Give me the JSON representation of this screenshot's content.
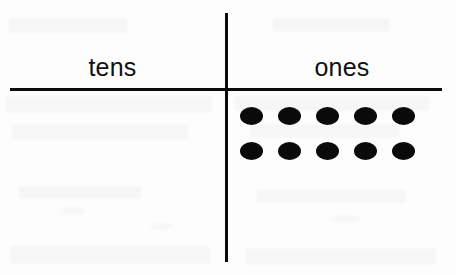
{
  "page": {
    "background_color": "#fdfdfd",
    "ink_color": "#0b0b0b",
    "width": 456,
    "height": 275
  },
  "chart_data": {
    "type": "table",
    "xlabel": "",
    "ylabel": "",
    "grid": false,
    "legend": null,
    "categories": [
      "tens",
      "ones"
    ],
    "values": [
      0,
      10
    ],
    "series": [
      {
        "name": "counters",
        "values": [
          0,
          10
        ]
      }
    ],
    "columns": [
      {
        "heading": "tens",
        "counter_count": 0,
        "rows": []
      },
      {
        "heading": "ones",
        "counter_count": 10,
        "rows": [
          {
            "dots": 5
          },
          {
            "dots": 5
          }
        ]
      }
    ],
    "annotations": []
  },
  "chart": {
    "divider_vertical": "vertical-divider",
    "divider_horizontal": "horizontal-divider",
    "tens_heading": "tens",
    "ones_heading": "ones"
  },
  "artifacts": {
    "description": "faint scanned bleed-through marks",
    "visible": true
  }
}
